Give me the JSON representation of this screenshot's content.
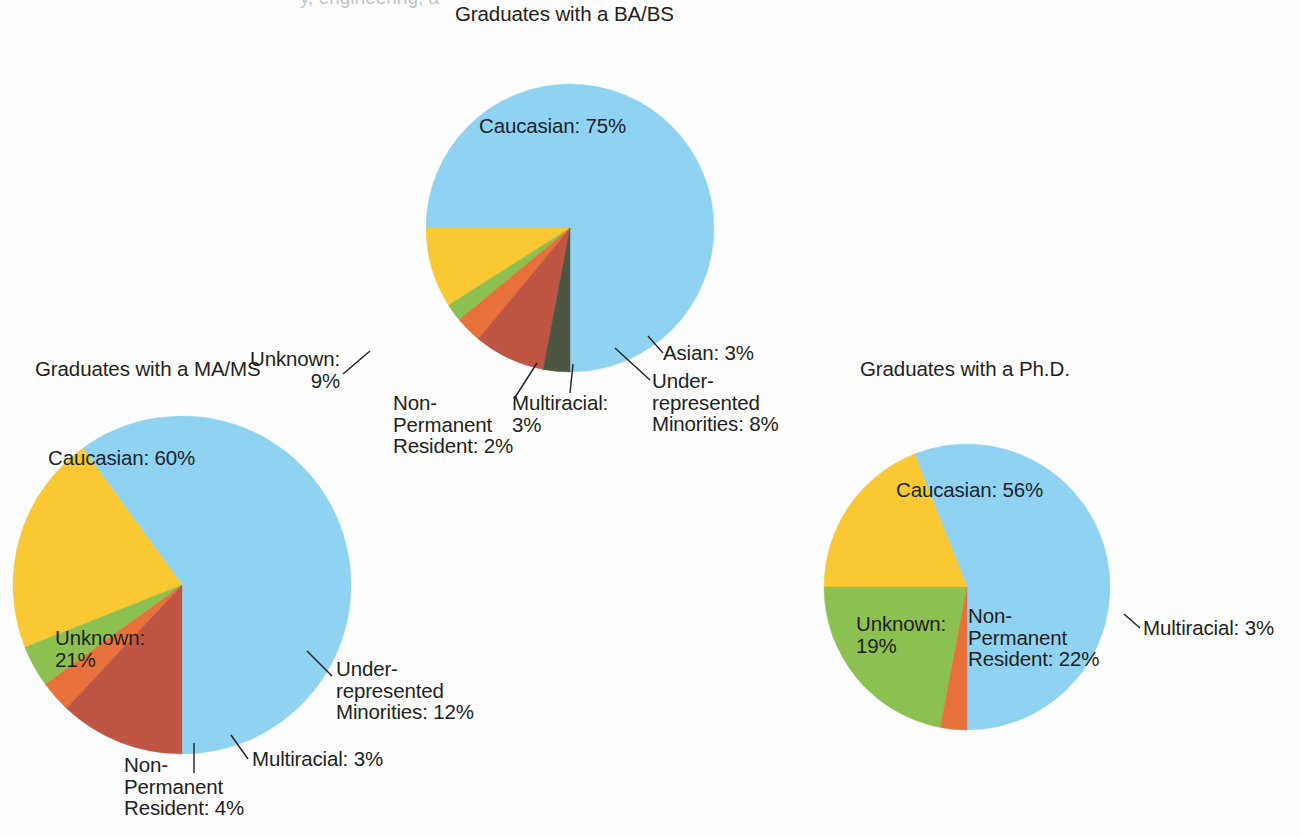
{
  "page": {
    "background_color": "#fefefe",
    "text_color": "#231f20",
    "clipped_top_text": "y, engineering, a"
  },
  "palette": {
    "caucasian": "#8FD2F1",
    "unknown": "#F9C832",
    "non_permanent_resident": "#8CC152",
    "multiracial": "#E8703A",
    "under_represented_minorities": "#BF5643",
    "asian": "#4C5642"
  },
  "charts": [
    {
      "id": "ba-bs",
      "title": "Graduates with a BA/BS",
      "labels": {
        "caucasian": "Caucasian: 75%",
        "unknown": "Unknown:\n9%",
        "non_permanent_resident": "Non-\nPermanent\nResident: 2%",
        "multiracial": "Multiracial:\n3%",
        "under_represented_minorities": "Under-\nrepresented\nMinorities: 8%",
        "asian": "Asian: 3%"
      }
    },
    {
      "id": "ma-ms",
      "title": "Graduates with a MA/MS",
      "labels": {
        "caucasian": "Caucasian: 60%",
        "unknown": "Unknown:\n21%",
        "non_permanent_resident": "Non-\nPermanent\nResident: 4%",
        "multiracial": "Multiracial: 3%",
        "under_represented_minorities": "Under-\nrepresented\nMinorities: 12%"
      }
    },
    {
      "id": "phd",
      "title": "Graduates with a Ph.D.",
      "labels": {
        "caucasian": "Caucasian: 56%",
        "unknown": "Unknown:\n19%",
        "non_permanent_resident": "Non-\nPermanent\nResident: 22%",
        "multiracial": "Multiracial: 3%"
      }
    }
  ],
  "chart_data": [
    {
      "type": "pie",
      "id": "ba-bs",
      "title": "Graduates with a BA/BS",
      "categories": [
        "Caucasian",
        "Unknown",
        "Non-Permanent Resident",
        "Multiracial",
        "Under-represented Minorities",
        "Asian"
      ],
      "values": [
        75,
        9,
        2,
        3,
        8,
        3
      ],
      "unit": "%",
      "colors": [
        "#8FD2F1",
        "#F9C832",
        "#8CC152",
        "#E8703A",
        "#BF5643",
        "#4C5642"
      ],
      "start_angle_deg": 180,
      "direction": "counterclockwise-from-bottom",
      "legend": "none",
      "data_labels": true
    },
    {
      "type": "pie",
      "id": "ma-ms",
      "title": "Graduates with a MA/MS",
      "categories": [
        "Caucasian",
        "Unknown",
        "Non-Permanent Resident",
        "Multiracial",
        "Under-represented Minorities"
      ],
      "values": [
        60,
        21,
        4,
        3,
        12
      ],
      "unit": "%",
      "colors": [
        "#8FD2F1",
        "#F9C832",
        "#8CC152",
        "#E8703A",
        "#BF5643"
      ],
      "start_angle_deg": 180,
      "direction": "counterclockwise-from-bottom",
      "legend": "none",
      "data_labels": true
    },
    {
      "type": "pie",
      "id": "phd",
      "title": "Graduates with a Ph.D.",
      "categories": [
        "Caucasian",
        "Unknown",
        "Non-Permanent Resident",
        "Multiracial"
      ],
      "values": [
        56,
        19,
        22,
        3
      ],
      "unit": "%",
      "colors": [
        "#8FD2F1",
        "#F9C832",
        "#8CC152",
        "#E8703A"
      ],
      "start_angle_deg": 180,
      "direction": "counterclockwise-from-bottom",
      "legend": "none",
      "data_labels": true
    }
  ]
}
